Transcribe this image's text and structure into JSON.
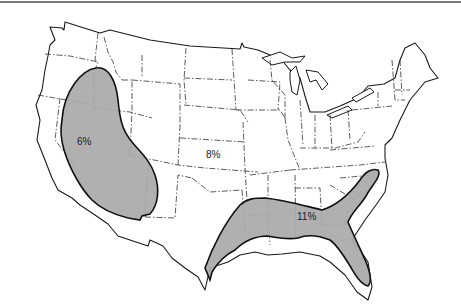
{
  "map": {
    "subject": "Contiguous United States",
    "style": "black-and-white line map with dash-dot state borders",
    "region_fill_color": "#a9a9a9",
    "background_color": "#ffffff",
    "outline_color": "#1a1a1a",
    "regions": [
      {
        "id": "southwest",
        "label": "6%",
        "description": "Shaded region covering Nevada, Utah, Arizona and parts of California/New Mexico",
        "shaded": true
      },
      {
        "id": "interior",
        "label": "8%",
        "description": "Unshaded remainder of the country",
        "shaded": false
      },
      {
        "id": "gulf-southeast",
        "label": "11%",
        "description": "Shaded region along the Gulf coast from Texas through Florida up to the Carolinas",
        "shaded": true
      }
    ]
  }
}
